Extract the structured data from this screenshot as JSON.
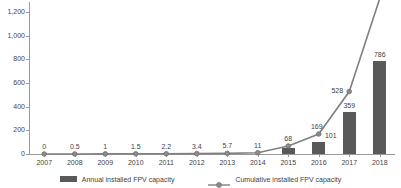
{
  "chart_data": {
    "type": "bar",
    "title": "",
    "xlabel": "",
    "ylabel": "MWp",
    "ylim": [
      0,
      1200
    ],
    "yticks": [
      0,
      200,
      400,
      600,
      800,
      1000,
      1200
    ],
    "ytick_labels": [
      "0",
      "200",
      "400",
      "600",
      "800",
      "1,000",
      "1,200"
    ],
    "grid": false,
    "legend_position": "bottom",
    "categories": [
      "2007",
      "2008",
      "2009",
      "2010",
      "2011",
      "2012",
      "2013",
      "2014",
      "2015",
      "2016",
      "2017",
      "2018"
    ],
    "series": [
      {
        "name": "Annual installed FPV capacity",
        "type": "bar",
        "color": "#595959",
        "values": [
          0,
          0,
          0,
          0,
          0,
          0,
          0,
          0,
          48,
          101,
          359,
          786
        ],
        "data_labels": [
          "",
          "",
          "",
          "",
          "",
          "",
          "",
          "",
          "",
          "101",
          "359",
          "786"
        ]
      },
      {
        "name": "Cumulative installed FPV capacity",
        "type": "line",
        "color": "#808080",
        "marker": "circle",
        "values": [
          0,
          0.5,
          1,
          1.5,
          2.2,
          3.4,
          5.7,
          11,
          68,
          169,
          528,
          1314
        ],
        "data_labels": [
          "0",
          "0.5",
          "1",
          "1.5",
          "2.2",
          "3.4",
          "5.7",
          "11",
          "68",
          "169",
          "528",
          ""
        ],
        "note_clipped_above_axis": "2018 cumulative value extends above the plotted axis range"
      }
    ]
  },
  "legend": {
    "items": [
      {
        "label": "Annual installed FPV capacity",
        "marker": "bar-swatch"
      },
      {
        "label": "Cumulative installed FPV capacity",
        "marker": "line-circle-swatch"
      }
    ]
  },
  "axis": {
    "y_title": "MWp",
    "y_tick_labels": [
      "1,200",
      "1,000",
      "800",
      "600",
      "400",
      "200",
      "0"
    ],
    "x_tick_labels": [
      "2007",
      "2008",
      "2009",
      "2010",
      "2011",
      "2012",
      "2013",
      "2014",
      "2015",
      "2016",
      "2017",
      "2018"
    ]
  },
  "labels": {
    "line_points": [
      "0",
      "0.5",
      "1",
      "1.5",
      "2.2",
      "3.4",
      "5.7",
      "11",
      "68",
      "169",
      "528"
    ],
    "bar_values": [
      "101",
      "359",
      "786"
    ]
  },
  "colors": {
    "bar": "#595959",
    "line": "#808080",
    "axis": "#9a9a9a",
    "text": "#3f3f3f",
    "background": "#ffffff"
  }
}
